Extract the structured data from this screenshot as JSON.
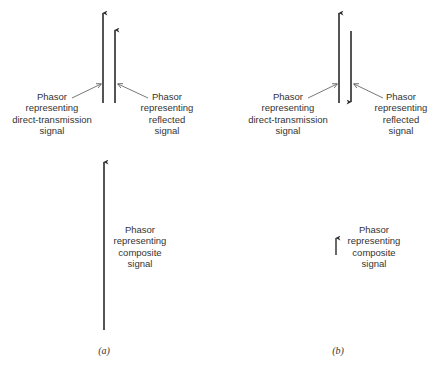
{
  "figure": {
    "panels": [
      {
        "id": "a",
        "caption": "(a)",
        "direct_label": [
          "Phasor",
          "representing",
          "direct-transmission",
          "signal"
        ],
        "reflected_label": [
          "Phasor",
          "representing",
          "reflected",
          "signal"
        ],
        "composite_label": [
          "Phasor",
          "representing",
          "composite",
          "signal"
        ],
        "reflected_direction": "up",
        "composite_size": "large"
      },
      {
        "id": "b",
        "caption": "(b)",
        "direct_label": [
          "Phasor",
          "representing",
          "direct-transmission",
          "signal"
        ],
        "reflected_label": [
          "Phasor",
          "representing",
          "reflected",
          "signal"
        ],
        "composite_label": [
          "Phasor",
          "representing",
          "composite",
          "signal"
        ],
        "reflected_direction": "down",
        "composite_size": "small"
      }
    ],
    "colors": {
      "stroke": "#2a2a2a",
      "leader": "#555555",
      "background": "#ffffff"
    }
  }
}
